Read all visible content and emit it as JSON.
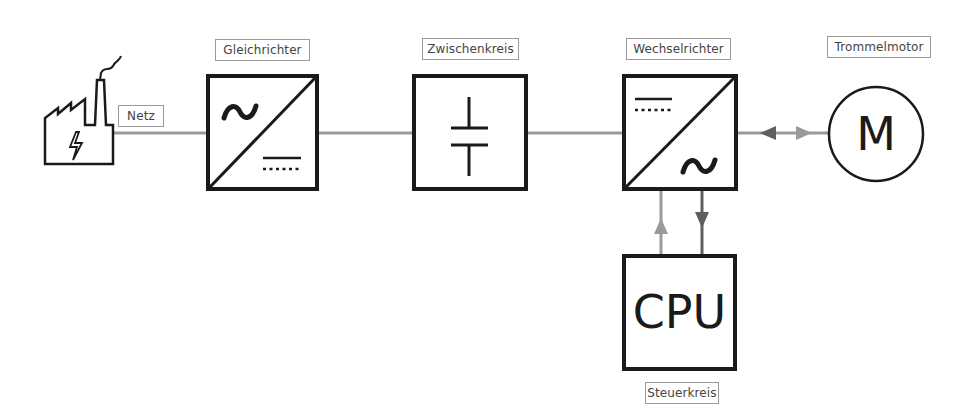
{
  "diagram": {
    "colors": {
      "stroke": "#1a1a1a",
      "connector": "#9a9a9a",
      "arrow_dark": "#5f5f5f",
      "arrow_light": "#9a9a9a",
      "label_border": "#9a9a9a"
    },
    "nodes": {
      "netz": {
        "label": "Netz",
        "icon": "factory-lightning-icon"
      },
      "gleichrichter": {
        "label": "Gleichrichter",
        "symbol_in": "~",
        "symbol_out": "DC"
      },
      "zwischenkreis": {
        "label": "Zwischenkreis",
        "symbol": "capacitor"
      },
      "wechselrichter": {
        "label": "Wechselrichter",
        "symbol_in": "DC",
        "symbol_out": "~"
      },
      "trommelmotor": {
        "label": "Trommelmotor",
        "symbol": "M"
      },
      "steuerkreis": {
        "label": "Steuerkreis",
        "symbol": "CPU"
      }
    },
    "edges": [
      {
        "from": "netz",
        "to": "gleichrichter",
        "type": "line"
      },
      {
        "from": "gleichrichter",
        "to": "zwischenkreis",
        "type": "line"
      },
      {
        "from": "zwischenkreis",
        "to": "wechselrichter",
        "type": "line"
      },
      {
        "from": "wechselrichter",
        "to": "trommelmotor",
        "type": "bidirectional-arrow"
      },
      {
        "from": "steuerkreis",
        "to": "wechselrichter",
        "type": "arrow-up"
      },
      {
        "from": "wechselrichter",
        "to": "steuerkreis",
        "type": "arrow-down"
      }
    ]
  }
}
